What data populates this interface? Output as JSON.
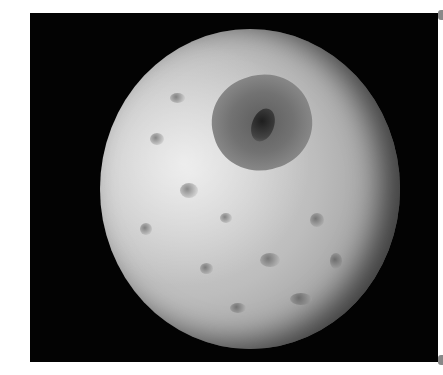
{
  "image": {
    "subject": "cratered-moon",
    "description": "Grayscale photograph of a heavily cratered moon with a large crater in the upper right, against a black background",
    "colors": {
      "page_background": "#ffffff",
      "space_background": "#030303",
      "surface_light": "#d9d9d9",
      "surface_dark": "#6a6a6a",
      "crater_floor": "#5d5d5d"
    }
  }
}
